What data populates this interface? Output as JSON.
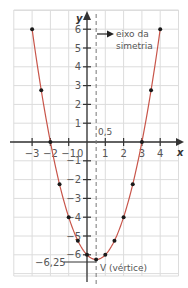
{
  "chart_data": {
    "type": "line",
    "title": "",
    "function": "y = x^2 - x - 6",
    "xlabel": "x",
    "ylabel": "y",
    "xlim": [
      -4,
      5
    ],
    "ylim": [
      -7,
      7
    ],
    "grid": true,
    "x_ticks": [
      -3,
      -2,
      -1,
      1,
      2,
      3,
      4
    ],
    "x_tick_labels": [
      "−3",
      "−2",
      "−1",
      "1",
      "2",
      "3",
      "4"
    ],
    "y_ticks": [
      6,
      5,
      4,
      3,
      2,
      1,
      -1,
      -2,
      -3,
      -4,
      -5,
      -6
    ],
    "y_tick_labels": [
      "6",
      "5",
      "4",
      "3",
      "2",
      "1",
      "−1",
      "−2",
      "−3",
      "−4",
      "−5",
      "−6"
    ],
    "origin_label": "0",
    "series": [
      {
        "name": "parábola",
        "color": "#c8554a",
        "points": [
          [
            -3,
            6
          ],
          [
            -2.5,
            2.75
          ],
          [
            -2,
            0
          ],
          [
            -1.5,
            -2.25
          ],
          [
            -1,
            -4
          ],
          [
            -0.5,
            -5.25
          ],
          [
            0,
            -6
          ],
          [
            0.5,
            -6.25
          ],
          [
            1,
            -6
          ],
          [
            1.5,
            -5.25
          ],
          [
            2,
            -4
          ],
          [
            2.5,
            -2.25
          ],
          [
            3,
            0
          ],
          [
            3.5,
            2.75
          ],
          [
            4,
            6
          ]
        ]
      }
    ],
    "annotations": {
      "axis_of_symmetry_x": 0.5,
      "axis_of_symmetry_label_line1": "eixo da",
      "axis_of_symmetry_label_line2": "simetria",
      "half_label": "0,5",
      "vertex": [
        0.5,
        -6.25
      ],
      "vertex_label": "V (vértice)",
      "vertex_y_label": "−6,25"
    }
  },
  "colors": {
    "curve": "#c8554a",
    "points": "#1a1a1a",
    "grid": "#dcdcdc",
    "axes": "#333333",
    "text": "#555555"
  }
}
